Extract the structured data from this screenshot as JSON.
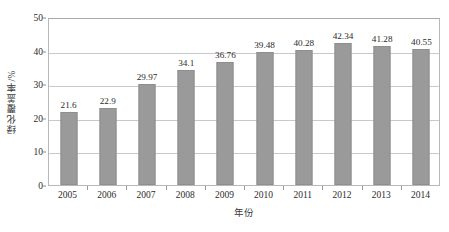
{
  "chart_data": {
    "type": "bar",
    "title": "",
    "xlabel": "年份",
    "ylabel": "绿化覆盖率/%",
    "categories": [
      "2005",
      "2006",
      "2007",
      "2008",
      "2009",
      "2010",
      "2011",
      "2012",
      "2013",
      "2014"
    ],
    "values": [
      21.6,
      22.9,
      29.97,
      34.1,
      36.76,
      39.48,
      40.28,
      42.34,
      41.28,
      40.55
    ],
    "value_labels": [
      "21.6",
      "22.9",
      "29.97",
      "34.1",
      "36.76",
      "39.48",
      "40.28",
      "42.34",
      "41.28",
      "40.55"
    ],
    "ylim": [
      0,
      50
    ],
    "yticks": [
      0,
      10,
      20,
      30,
      40,
      50
    ],
    "ytick_labels": [
      "0",
      "10",
      "20",
      "30",
      "40",
      "50"
    ],
    "grid": true,
    "legend": null,
    "series": [
      {
        "name": "绿化覆盖率",
        "values": [
          21.6,
          22.9,
          29.97,
          34.1,
          36.76,
          39.48,
          40.28,
          42.34,
          41.28,
          40.55
        ],
        "color": "#9a9a9a"
      }
    ],
    "colors": {
      "bar_fill": "#9a9a9a",
      "bar_border": "#8e8e8e",
      "gridline": "#c9c9c9",
      "axis": "#b8b8b8",
      "text": "#2b2b2b"
    }
  }
}
